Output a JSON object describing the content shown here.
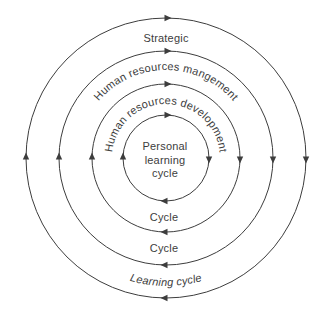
{
  "diagram": {
    "center": {
      "lines": [
        "Personal",
        "learning",
        "cycle"
      ]
    },
    "rings": [
      {
        "top_label": "Strategic",
        "bottom_label": "Learning cycle"
      },
      {
        "top_label": "Human resources mangement",
        "bottom_label": "Cycle"
      },
      {
        "top_label": "Human resources development",
        "bottom_label": "Cycle"
      }
    ],
    "flow_direction": "clockwise",
    "colors": {
      "line": "#3d3d3d",
      "text": "#3d3d3d",
      "background": "#ffffff"
    }
  }
}
